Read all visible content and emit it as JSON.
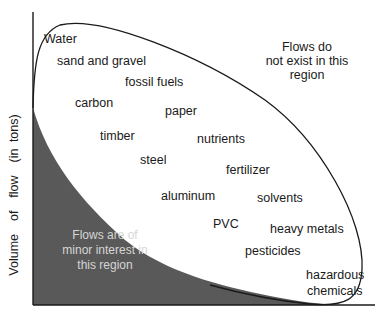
{
  "diagram": {
    "type": "conceptual-region-plot",
    "y_axis_label": "Volume  of  flow  (in tons)",
    "x_axis_label": "",
    "regions": {
      "upper_right_note": [
        "Flows do",
        "not exist in this",
        "region"
      ],
      "lower_left_note": [
        "Flows are of",
        "minor interest in",
        "this region"
      ]
    },
    "materials": [
      {
        "label": "Water",
        "x": 44,
        "y": 32
      },
      {
        "label": "sand and gravel",
        "x": 57,
        "y": 54
      },
      {
        "label": "fossil fuels",
        "x": 125,
        "y": 75
      },
      {
        "label": "carbon",
        "x": 75,
        "y": 96
      },
      {
        "label": "paper",
        "x": 165,
        "y": 104
      },
      {
        "label": "timber",
        "x": 100,
        "y": 129
      },
      {
        "label": "nutrients",
        "x": 197,
        "y": 132
      },
      {
        "label": "steel",
        "x": 140,
        "y": 153
      },
      {
        "label": "fertilizer",
        "x": 226,
        "y": 163
      },
      {
        "label": "aluminum",
        "x": 161,
        "y": 189
      },
      {
        "label": "solvents",
        "x": 257,
        "y": 191
      },
      {
        "label": "PVC",
        "x": 213,
        "y": 217
      },
      {
        "label": "heavy metals",
        "x": 270,
        "y": 222
      },
      {
        "label": "pesticides",
        "x": 245,
        "y": 244
      },
      {
        "label": "hazardous",
        "x": 306,
        "y": 268
      },
      {
        "label": "chemicals",
        "x": 307,
        "y": 284
      }
    ],
    "colors": {
      "dark_region": "#595959",
      "axis": "#1a1a1a",
      "ellipse_stroke": "#1a1a1a",
      "background": "#ffffff"
    }
  }
}
